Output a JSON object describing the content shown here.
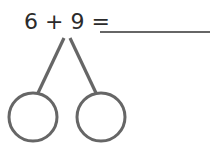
{
  "problem": {
    "equation_text": "6 + 9 =",
    "operand_a": "6",
    "operator": "+",
    "operand_b": "9",
    "equals": "=",
    "answer_blank": ""
  },
  "number_bond": {
    "parts": [
      {
        "label": "left-part",
        "value": ""
      },
      {
        "label": "right-part",
        "value": ""
      }
    ]
  },
  "colors": {
    "stroke": "#666666",
    "text": "#2b2b2b",
    "background": "#ffffff"
  }
}
